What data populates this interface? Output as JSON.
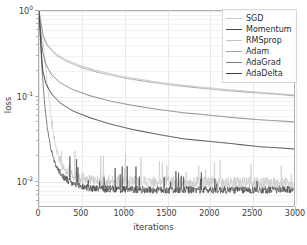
{
  "chart_data": {
    "type": "line",
    "title": "",
    "xlabel": "iterations",
    "ylabel": "loss",
    "xlim": [
      0,
      3000
    ],
    "ylim": [
      0.005,
      1.0
    ],
    "yscale": "log",
    "grid": true,
    "legend_position": "upper right",
    "xticks": [
      "0",
      "500",
      "1000",
      "1500",
      "2000",
      "2500",
      "3000"
    ],
    "xtick_values": [
      0,
      500,
      1000,
      1500,
      2000,
      2500,
      3000
    ],
    "yticks": [
      "10^0",
      "10^-1",
      "10^-2"
    ],
    "ytick_values": [
      1.0,
      0.1,
      0.01
    ],
    "ytick_mantissas": [
      "10",
      "10",
      "10"
    ],
    "ytick_exponents": [
      "0",
      "-1",
      "-2"
    ],
    "series": [
      {
        "name": "SGD",
        "color": "#c9c9c9",
        "noisy": true,
        "noise_amp": 0.16,
        "x": [
          0,
          30,
          60,
          100,
          150,
          200,
          250,
          300,
          400,
          500,
          700,
          900,
          1100,
          1300,
          1500,
          1700,
          1900,
          2100,
          2300,
          2500,
          2700,
          2900,
          3000
        ],
        "values": [
          1.0,
          0.62,
          0.34,
          0.13,
          0.046,
          0.024,
          0.0165,
          0.0135,
          0.0112,
          0.0103,
          0.0098,
          0.0096,
          0.0095,
          0.0094,
          0.0094,
          0.0093,
          0.0093,
          0.0092,
          0.0092,
          0.0092,
          0.0091,
          0.0091,
          0.0091
        ]
      },
      {
        "name": "Momentum",
        "color": "#4a4a4a",
        "noisy": true,
        "noise_amp": 0.1,
        "x": [
          0,
          20,
          40,
          70,
          100,
          140,
          180,
          220,
          280,
          350,
          450,
          600,
          800,
          1000,
          1300,
          1600,
          1900,
          2200,
          2500,
          2800,
          3000
        ],
        "values": [
          1.0,
          0.4,
          0.175,
          0.072,
          0.04,
          0.0235,
          0.0168,
          0.0135,
          0.011,
          0.0096,
          0.0086,
          0.008,
          0.0078,
          0.0077,
          0.0076,
          0.0076,
          0.0076,
          0.0076,
          0.0076,
          0.0076,
          0.0076
        ]
      },
      {
        "name": "RMSprop",
        "color": "#c4c4c4",
        "noisy": false,
        "x": [
          0,
          50,
          100,
          200,
          300,
          500,
          700,
          1000,
          1300,
          1600,
          1900,
          2200,
          2500,
          2800,
          3000
        ],
        "values": [
          1.0,
          0.52,
          0.4,
          0.315,
          0.272,
          0.224,
          0.196,
          0.168,
          0.15,
          0.137,
          0.127,
          0.119,
          0.112,
          0.106,
          0.102
        ]
      },
      {
        "name": "Adam",
        "color": "#a5a5a5",
        "noisy": false,
        "x": [
          0,
          50,
          100,
          200,
          300,
          500,
          700,
          1000,
          1300,
          1600,
          1900,
          2200,
          2500,
          2800,
          3000
        ],
        "values": [
          1.0,
          0.5,
          0.385,
          0.302,
          0.261,
          0.215,
          0.188,
          0.162,
          0.145,
          0.132,
          0.123,
          0.115,
          0.109,
          0.104,
          0.1
        ]
      },
      {
        "name": "AdaGrad",
        "color": "#7d7d7d",
        "noisy": false,
        "x": [
          0,
          40,
          80,
          150,
          250,
          400,
          600,
          850,
          1100,
          1400,
          1700,
          2000,
          2300,
          2600,
          2900,
          3000
        ],
        "values": [
          1.0,
          0.34,
          0.235,
          0.176,
          0.142,
          0.118,
          0.1,
          0.086,
          0.077,
          0.069,
          0.063,
          0.059,
          0.055,
          0.052,
          0.05,
          0.049
        ]
      },
      {
        "name": "AdaDelta",
        "color": "#3c3c3c",
        "noisy": false,
        "x": [
          0,
          40,
          80,
          150,
          250,
          400,
          600,
          850,
          1100,
          1400,
          1700,
          2000,
          2300,
          2600,
          2900,
          3000
        ],
        "values": [
          1.0,
          0.205,
          0.14,
          0.104,
          0.082,
          0.066,
          0.055,
          0.046,
          0.04,
          0.035,
          0.031,
          0.029,
          0.027,
          0.025,
          0.024,
          0.0235
        ]
      }
    ]
  }
}
